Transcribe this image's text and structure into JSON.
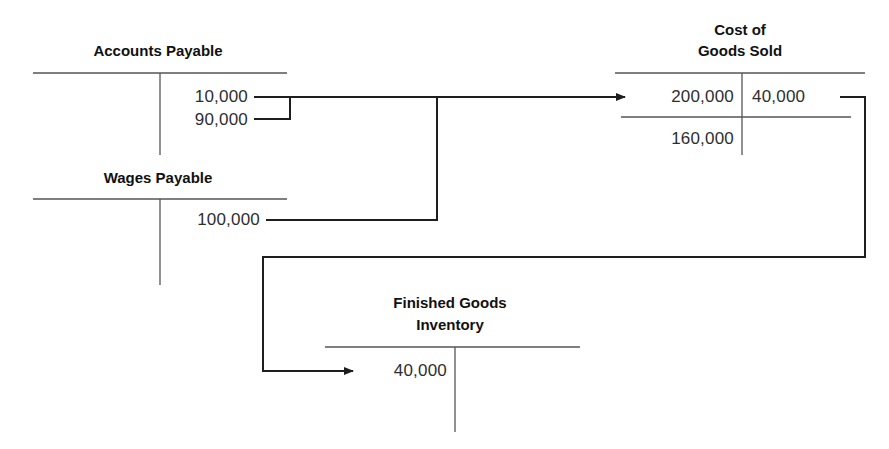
{
  "accounts": {
    "accounts_payable": {
      "title": "Accounts Payable",
      "debits": [],
      "credits": [
        "10,000",
        "90,000"
      ]
    },
    "wages_payable": {
      "title": "Wages Payable",
      "debits": [],
      "credits": [
        "100,000"
      ]
    },
    "cost_of_goods_sold": {
      "title_line1": "Cost of",
      "title_line2": "Goods Sold",
      "debits": [
        "200,000"
      ],
      "credits": [
        "40,000"
      ],
      "balance": "160,000"
    },
    "finished_goods_inventory": {
      "title_line1": "Finished Goods",
      "title_line2": "Inventory",
      "debits": [
        "40,000"
      ],
      "credits": []
    }
  },
  "flows": [
    {
      "from": "Accounts Payable 10,000 + 90,000",
      "to": "Cost of Goods Sold 200,000"
    },
    {
      "from": "Wages Payable 100,000",
      "to": "Cost of Goods Sold 200,000"
    },
    {
      "from": "Cost of Goods Sold 40,000",
      "to": "Finished Goods Inventory 40,000"
    }
  ],
  "colors": {
    "line": "#1e1e1e",
    "t_account_rule": "#555555",
    "text": "#2e2e2e"
  }
}
